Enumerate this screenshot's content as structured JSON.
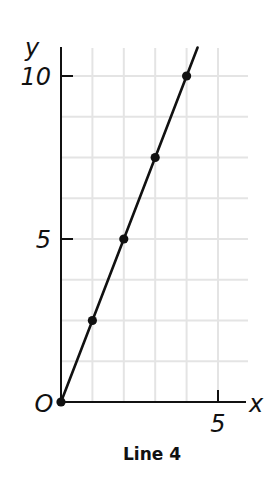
{
  "chart_data": {
    "type": "line",
    "title": "Line 4",
    "xlabel": "x",
    "ylabel": "y",
    "origin_label": "O",
    "xlim": [
      0,
      6
    ],
    "ylim": [
      0,
      11
    ],
    "x_ticks": [
      {
        "value": 5,
        "label": "5"
      }
    ],
    "y_ticks": [
      {
        "value": 5,
        "label": "5"
      },
      {
        "value": 10,
        "label": "10"
      }
    ],
    "grid": true,
    "grid_x_step": 1,
    "grid_y_step": 1.25,
    "series": [
      {
        "name": "Line 4",
        "x": [
          0,
          1,
          2,
          3,
          4
        ],
        "y": [
          0,
          2.5,
          5,
          7.5,
          10
        ],
        "markers": true,
        "extends_to_x": 4.35
      }
    ],
    "colors": {
      "line": "#111111",
      "grid": "#e4e4e4",
      "axis": "#111111"
    }
  }
}
